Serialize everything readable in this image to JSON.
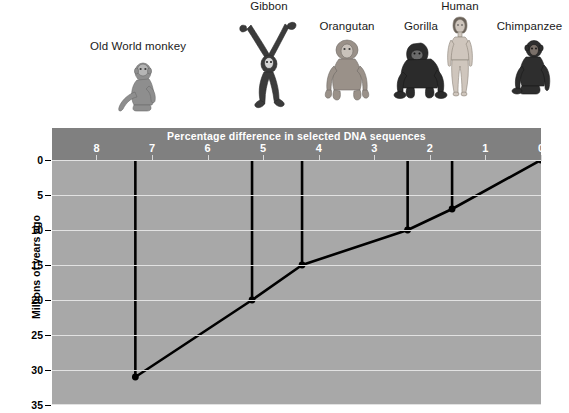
{
  "figure": {
    "xaxis_title": "Percentage difference in selected DNA sequences",
    "yaxis_title": "Millions of years ago"
  },
  "organisms": [
    {
      "name": "Old World monkey",
      "label": "Old World monkey"
    },
    {
      "name": "Gibbon",
      "label": "Gibbon"
    },
    {
      "name": "Orangutan",
      "label": "Orangutan"
    },
    {
      "name": "Gorilla",
      "label": "Gorilla"
    },
    {
      "name": "Human",
      "label": "Human"
    },
    {
      "name": "Chimpanzee",
      "label": "Chimpanzee"
    }
  ],
  "xticks": [
    {
      "label": "8",
      "value": 8
    },
    {
      "label": "7",
      "value": 7
    },
    {
      "label": "6",
      "value": 6
    },
    {
      "label": "5",
      "value": 5
    },
    {
      "label": "4",
      "value": 4
    },
    {
      "label": "3",
      "value": 3
    },
    {
      "label": "2",
      "value": 2
    },
    {
      "label": "1",
      "value": 1
    },
    {
      "label": "0",
      "value": 0
    }
  ],
  "yticks": [
    {
      "label": "0",
      "value": 0
    },
    {
      "label": "5",
      "value": 5
    },
    {
      "label": "10",
      "value": 10
    },
    {
      "label": "15",
      "value": 15
    },
    {
      "label": "20",
      "value": 20
    },
    {
      "label": "25",
      "value": 25
    },
    {
      "label": "30",
      "value": 30
    },
    {
      "label": "35",
      "value": 35
    }
  ],
  "colors": {
    "band": "#808080",
    "plot": "#a8a8a8",
    "gridline": "#e2e2e2",
    "line": "#000000",
    "band_text": "#ffffff",
    "axis_text": "#000000"
  },
  "chart_data": {
    "type": "line",
    "title": "Percentage difference in selected DNA sequences",
    "xlabel": "Percentage difference in selected DNA sequences",
    "ylabel": "Millions of years ago",
    "xlim": [
      8.8,
      0
    ],
    "ylim": [
      0,
      35
    ],
    "x_axis_reversed": true,
    "grid": true,
    "legend": "none",
    "x_tick_labels": [
      "8",
      "7",
      "6",
      "5",
      "4",
      "3",
      "2",
      "1",
      "0"
    ],
    "x_tick_values": [
      8,
      7,
      6,
      5,
      4,
      3,
      2,
      1,
      0
    ],
    "y_tick_labels": [
      "0",
      "5",
      "10",
      "15",
      "20",
      "25",
      "30",
      "35"
    ],
    "y_tick_values": [
      0,
      5,
      10,
      15,
      20,
      25,
      30,
      35
    ],
    "series": [
      {
        "name": "Divergence from human lineage",
        "x": [
          7.3,
          5.2,
          4.3,
          2.4,
          1.6,
          0
        ],
        "y": [
          31,
          20,
          15,
          10,
          7,
          0
        ],
        "point_labels": [
          "Old World monkey",
          "Gibbon",
          "Orangutan",
          "Gorilla",
          "Chimpanzee",
          "Human"
        ],
        "marker": "circle",
        "color": "#000000"
      }
    ],
    "drop_lines": [
      {
        "label": "Old World monkey",
        "x": 7.3,
        "y_from": 0,
        "y_to": 31
      },
      {
        "label": "Gibbon",
        "x": 5.2,
        "y_from": 0,
        "y_to": 20
      },
      {
        "label": "Orangutan",
        "x": 4.3,
        "y_from": 0,
        "y_to": 15
      },
      {
        "label": "Gorilla",
        "x": 2.4,
        "y_from": 0,
        "y_to": 10
      },
      {
        "label": "Chimpanzee",
        "x": 1.6,
        "y_from": 0,
        "y_to": 7
      }
    ]
  }
}
